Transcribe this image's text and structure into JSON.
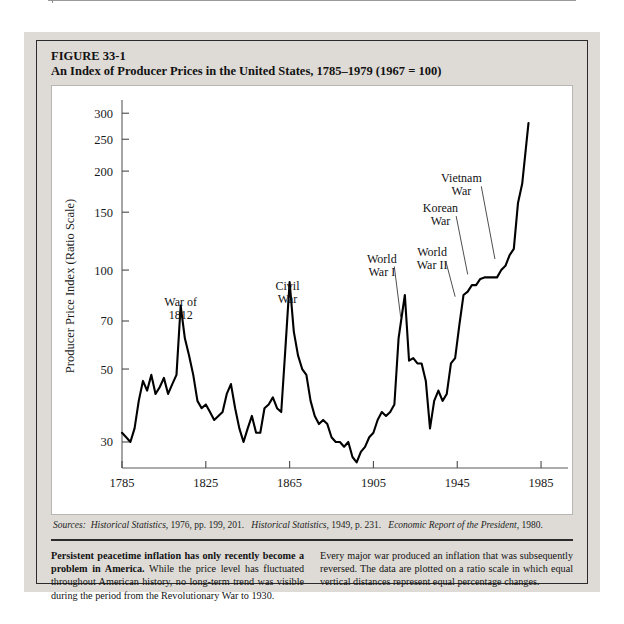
{
  "running_head": {
    "text": "VARIATIONS ON MONEY AND MONETARY INSTITUTIONS",
    "page_number": "575"
  },
  "figure": {
    "number": "FIGURE 33-1",
    "title": "An Index of Producer Prices in the United States, 1785–1979 (1967 = 100)"
  },
  "sources": {
    "label": "Sources:",
    "items": [
      {
        "work": "Historical Statistics,",
        "detail": " 1976, pp. 199, 201."
      },
      {
        "work": "Historical Statistics,",
        "detail": " 1949, p. 231."
      },
      {
        "work": "Economic Report of the President,",
        "detail": " 1980."
      }
    ]
  },
  "caption": {
    "left_bold": "Persistent peacetime inflation has only recently become a problem in America.",
    "left_rest": " While the price level has fluctuated throughout American history, no long-term trend was visible during the period from the Revolutionary War to 1930.",
    "right": "Every major war produced an inflation that was subsequently reversed. The data are plotted on a ratio scale in which equal vertical distances represent equal percentage changes."
  },
  "chart_data": {
    "type": "line",
    "title": "An Index of Producer Prices in the United States, 1785–1979 (1967 = 100)",
    "xlabel": "",
    "ylabel": "Producer Price Index (Ratio Scale)",
    "yscale": "log",
    "ylim": [
      25,
      320
    ],
    "xlim": [
      1785,
      1995
    ],
    "grid": false,
    "legend": "none",
    "ytick_labels": [
      "300",
      "250",
      "200",
      "150",
      "100",
      "70",
      "50",
      "30"
    ],
    "ytick_values": [
      300,
      250,
      200,
      150,
      100,
      70,
      50,
      30
    ],
    "xtick_labels": [
      "1785",
      "1825",
      "1865",
      "1905",
      "1945",
      "1985"
    ],
    "xtick_values": [
      1785,
      1825,
      1865,
      1905,
      1945,
      1985
    ],
    "annotations": [
      {
        "label": "War of 1812",
        "lines": [
          "War of",
          "1812"
        ],
        "x": 1813,
        "y": 78,
        "leader": false
      },
      {
        "label": "Civil War",
        "lines": [
          "Civil",
          "War"
        ],
        "x": 1864,
        "y": 87,
        "leader": false
      },
      {
        "label": "World War I",
        "lines": [
          "World",
          "War I"
        ],
        "x": 1909,
        "y": 105,
        "leader": true
      },
      {
        "label": "World War II",
        "lines": [
          "World",
          "War II"
        ],
        "x": 1933,
        "y": 110,
        "leader": true
      },
      {
        "label": "Korean War",
        "lines": [
          "Korean",
          "War"
        ],
        "x": 1937,
        "y": 150,
        "leader": true
      },
      {
        "label": "Vietnam War",
        "lines": [
          "Vietnam",
          "War"
        ],
        "x": 1947,
        "y": 185,
        "leader": true
      }
    ],
    "x": [
      1785,
      1787,
      1789,
      1791,
      1793,
      1795,
      1797,
      1799,
      1801,
      1803,
      1805,
      1807,
      1809,
      1811,
      1813,
      1815,
      1817,
      1819,
      1821,
      1823,
      1825,
      1827,
      1829,
      1831,
      1833,
      1835,
      1837,
      1839,
      1841,
      1843,
      1845,
      1847,
      1849,
      1851,
      1853,
      1855,
      1857,
      1859,
      1861,
      1863,
      1865,
      1867,
      1869,
      1871,
      1873,
      1875,
      1877,
      1879,
      1881,
      1883,
      1885,
      1887,
      1889,
      1891,
      1893,
      1895,
      1897,
      1899,
      1901,
      1903,
      1905,
      1907,
      1909,
      1911,
      1913,
      1915,
      1917,
      1919,
      1920,
      1922,
      1924,
      1926,
      1928,
      1930,
      1932,
      1934,
      1936,
      1938,
      1940,
      1942,
      1944,
      1946,
      1948,
      1950,
      1952,
      1954,
      1956,
      1958,
      1960,
      1962,
      1964,
      1966,
      1968,
      1970,
      1972,
      1974,
      1976,
      1979
    ],
    "y": [
      32,
      31,
      30,
      33,
      40,
      46,
      43,
      48,
      42,
      44,
      47,
      42,
      45,
      48,
      78,
      62,
      55,
      48,
      40,
      38,
      39,
      37,
      35,
      36,
      37,
      42,
      45,
      38,
      33,
      30,
      33,
      36,
      32,
      32,
      38,
      39,
      41,
      38,
      37,
      58,
      92,
      65,
      55,
      50,
      48,
      40,
      36,
      34,
      35,
      34,
      31,
      30,
      30,
      29,
      30,
      27,
      26,
      28,
      29,
      31,
      32,
      35,
      37,
      36,
      37,
      39,
      62,
      76,
      84,
      53,
      54,
      52,
      52,
      46,
      33,
      40,
      43,
      40,
      42,
      52,
      54,
      68,
      84,
      86,
      90,
      90,
      94,
      95,
      95,
      95,
      95,
      100,
      103,
      111,
      116,
      160,
      183,
      280
    ]
  }
}
